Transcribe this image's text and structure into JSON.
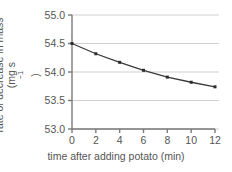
{
  "chart_data": {
    "type": "line",
    "title": "",
    "xlabel": "time after adding potato (min)",
    "ylabel_line1": "rate of decrease in mass",
    "ylabel_line2_prefix": "(mg s",
    "ylabel_line2_sup": "−1",
    "ylabel_line2_suffix": ")",
    "ylabel_full": "rate of decrease in mass (mg s−1)",
    "x": [
      0,
      2,
      4,
      6,
      8,
      10,
      12
    ],
    "values": [
      54.5,
      54.32,
      54.17,
      54.03,
      53.91,
      53.82,
      53.74
    ],
    "xlim": [
      0,
      12
    ],
    "ylim": [
      53.0,
      55.0
    ],
    "xticks": [
      "0",
      "2",
      "4",
      "6",
      "8",
      "10",
      "12"
    ],
    "xtick_values": [
      0,
      2,
      4,
      6,
      8,
      10,
      12
    ],
    "yticks": [
      "53.0",
      "53.5",
      "54.0",
      "54.5",
      "55.0"
    ],
    "ytick_values": [
      53.0,
      53.5,
      54.0,
      54.5,
      55.0
    ],
    "grid": "horizontal",
    "gridline_color": "#cfcfcf",
    "line_color": "#3a3a3a",
    "marker": "square",
    "marker_color": "#2b2b2b",
    "axis_color": "#7a7a7a",
    "background_color": "#ffffff",
    "legend": null
  }
}
